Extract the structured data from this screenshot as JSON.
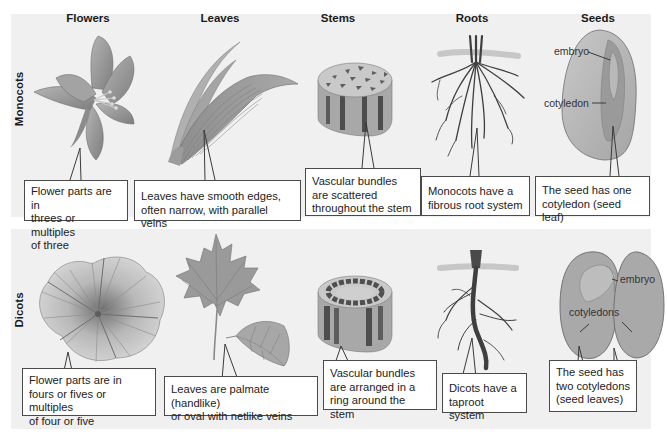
{
  "column_headers": [
    "Flowers",
    "Leaves",
    "Stems",
    "Roots",
    "Seeds"
  ],
  "rows": [
    {
      "label": "Monocots",
      "callouts": [
        {
          "feature": "Flowers",
          "text_lines": [
            "Flower parts are in",
            "threes or multiples",
            "of three"
          ]
        },
        {
          "feature": "Leaves",
          "text_lines": [
            "Leaves have smooth edges,",
            "often narrow, with parallel veins"
          ]
        },
        {
          "feature": "Stems",
          "text_lines": [
            "Vascular bundles",
            "are scattered",
            "throughout the stem"
          ]
        },
        {
          "feature": "Roots",
          "text_lines": [
            "Monocots have a",
            "fibrous root system"
          ]
        },
        {
          "feature": "Seeds",
          "text_lines": [
            "The seed has one",
            "cotyledon (seed leaf)"
          ]
        }
      ],
      "seed_labels": [
        "embryo",
        "cotyledon"
      ]
    },
    {
      "label": "Dicots",
      "callouts": [
        {
          "feature": "Flowers",
          "text_lines": [
            "Flower parts are in",
            "fours or fives or multiples",
            "of four or five"
          ]
        },
        {
          "feature": "Leaves",
          "text_lines": [
            "Leaves are palmate (handlike)",
            "or oval with netlike veins"
          ]
        },
        {
          "feature": "Stems",
          "text_lines": [
            "Vascular bundles",
            "are arranged in a",
            "ring around the stem"
          ]
        },
        {
          "feature": "Roots",
          "text_lines": [
            "Dicots have a",
            "taproot system"
          ]
        },
        {
          "feature": "Seeds",
          "text_lines": [
            "The seed has",
            "two cotyledons",
            "(seed leaves)"
          ]
        }
      ],
      "seed_labels": [
        "embryo",
        "cotyledons"
      ]
    }
  ],
  "colors": {
    "panel_bg": "#f0f0f0",
    "callout_border": "#4a4a4a",
    "illustration_mid": "#9a9a9a",
    "illustration_dark": "#4f4f4f",
    "illustration_light": "#c8c8c8"
  }
}
